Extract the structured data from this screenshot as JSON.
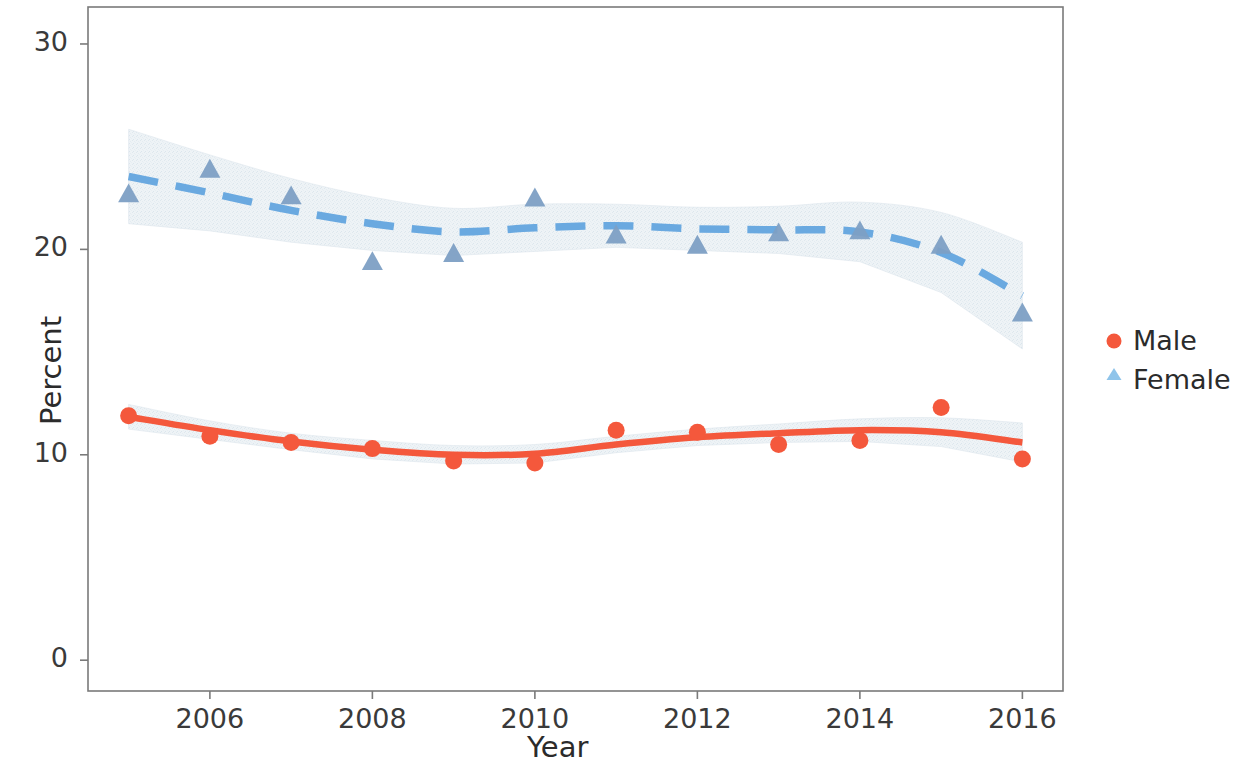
{
  "chart_data": {
    "type": "line",
    "title": "",
    "xlabel": "Year",
    "ylabel": "Percent",
    "x": [
      2005,
      2006,
      2007,
      2008,
      2009,
      2010,
      2011,
      2012,
      2013,
      2014,
      2015,
      2016
    ],
    "xlim": [
      2004.5,
      2016.5
    ],
    "ylim": [
      -1.5,
      31.8
    ],
    "xticks": [
      2006,
      2008,
      2010,
      2012,
      2014,
      2016
    ],
    "xtick_labels": [
      "2006",
      "2008",
      "2010",
      "2012",
      "2014",
      "2016"
    ],
    "yticks": [
      0,
      10,
      20,
      30
    ],
    "ytick_labels": [
      "0",
      "10",
      "20",
      "30"
    ],
    "grid": false,
    "legend_position": "right",
    "series": [
      {
        "name": "Male",
        "color": "#f4583c",
        "marker": "circle",
        "linestyle": "solid",
        "values": [
          11.9,
          10.9,
          10.6,
          10.3,
          9.7,
          9.6,
          11.2,
          11.1,
          10.5,
          10.7,
          12.3,
          9.8
        ],
        "fit": [
          11.85,
          11.2,
          10.65,
          10.25,
          10.0,
          10.05,
          10.5,
          10.85,
          11.05,
          11.2,
          11.1,
          10.6
        ],
        "ci_low": [
          11.25,
          10.75,
          10.25,
          9.8,
          9.55,
          9.6,
          10.1,
          10.45,
          10.6,
          10.65,
          10.4,
          9.65
        ],
        "ci_high": [
          12.45,
          11.65,
          11.05,
          10.7,
          10.45,
          10.5,
          10.9,
          11.25,
          11.5,
          11.75,
          11.8,
          11.55
        ]
      },
      {
        "name": "Female",
        "color": "#6aa9e0",
        "marker": "triangle",
        "linestyle": "dashed",
        "values": [
          22.7,
          23.9,
          22.6,
          19.4,
          19.8,
          22.5,
          20.7,
          20.2,
          20.8,
          20.9,
          20.2,
          16.9
        ],
        "fit": [
          23.55,
          22.75,
          21.9,
          21.25,
          20.85,
          21.05,
          21.15,
          21.0,
          20.95,
          20.85,
          19.85,
          17.75
        ],
        "ci_low": [
          21.25,
          20.9,
          20.35,
          19.95,
          19.7,
          19.9,
          20.1,
          19.95,
          19.8,
          19.4,
          17.9,
          15.15
        ],
        "ci_high": [
          25.85,
          24.6,
          23.45,
          22.55,
          22.0,
          22.2,
          22.2,
          22.05,
          22.1,
          22.3,
          21.8,
          20.35
        ]
      }
    ],
    "band_color": "#e9eff3"
  },
  "legend": {
    "items": [
      {
        "label": "Male",
        "marker": "circle",
        "color": "#f4583c"
      },
      {
        "label": "Female",
        "marker": "triangle",
        "color": "#8fc4ea"
      }
    ]
  },
  "axes": {
    "x_title": "Year",
    "y_title": "Percent",
    "frame_color": "#7a7a7a"
  }
}
